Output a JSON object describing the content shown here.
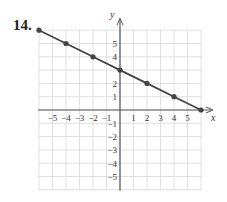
{
  "problem": {
    "number": "14."
  },
  "chart_data": {
    "type": "line",
    "title": "",
    "xlabel": "x",
    "ylabel": "y",
    "xlim": [
      -6,
      6
    ],
    "ylim": [
      -6,
      6
    ],
    "grid": true,
    "x_ticks": [
      -5,
      -4,
      -3,
      -2,
      -1,
      1,
      2,
      3,
      4,
      5
    ],
    "y_ticks": [
      -5,
      -4,
      -3,
      -2,
      -1,
      1,
      2,
      4,
      5
    ],
    "series": [
      {
        "name": "line",
        "points": [
          [
            -6,
            6
          ],
          [
            -4,
            5
          ],
          [
            -2,
            4
          ],
          [
            0,
            3
          ],
          [
            2,
            2
          ],
          [
            4,
            1
          ],
          [
            6,
            0
          ]
        ],
        "color": "#444444"
      }
    ],
    "colors": {
      "grid": "#d8d8d8",
      "axis": "#555555",
      "line": "#444444"
    }
  }
}
